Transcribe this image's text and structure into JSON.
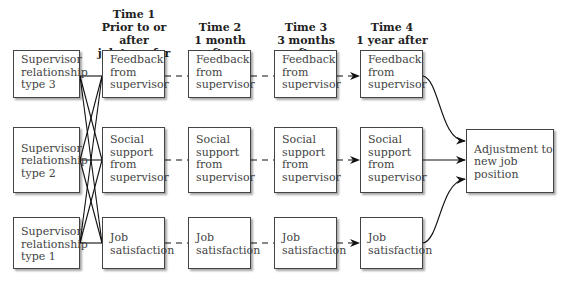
{
  "headers": [
    {
      "line1": "Time 1",
      "line2": "Prior to or after",
      "line3": "job transfer"
    },
    {
      "line1": "Time 2",
      "line2": "1 month after"
    },
    {
      "line1": "Time 3",
      "line2": "3 months after"
    },
    {
      "line1": "Time 4",
      "line2": "1 year after"
    }
  ],
  "supervisor_types": [
    {
      "label": "Supervisor\nrelationship\ntype 3"
    },
    {
      "label": "Supervisor\nrelationship\ntype 2"
    },
    {
      "label": "Supervisor\nrelationship\ntype 1"
    }
  ],
  "variables": [
    {
      "label": "Feedback\nfrom\nsupervisor"
    },
    {
      "label": "Social\nsupport\nfrom\nsupervisor"
    },
    {
      "label": "Job\nsatisfaction"
    }
  ],
  "outcome": {
    "label": "Adjustment to\nnew job position"
  },
  "colors": {
    "line": "#111111",
    "border": "#444444",
    "text": "#333333"
  }
}
